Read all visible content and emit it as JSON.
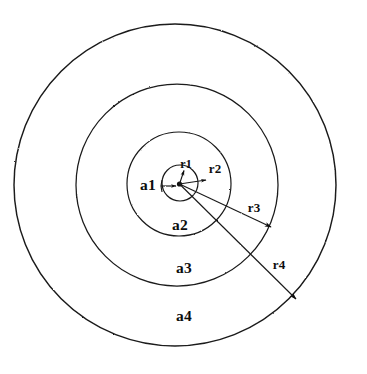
{
  "figure": {
    "background_color": "#ffffff",
    "stroke_color": "#1a1a1a",
    "center": {
      "x": 179,
      "y": 183
    },
    "zone_labels": [
      {
        "id": "a1",
        "text": "a1",
        "x": 148,
        "y": 189
      },
      {
        "id": "a2",
        "text": "a2",
        "x": 180,
        "y": 229
      },
      {
        "id": "a3",
        "text": "a3",
        "x": 184,
        "y": 272
      },
      {
        "id": "a4",
        "text": "a4",
        "x": 184,
        "y": 320
      }
    ],
    "radius_labels": [
      {
        "id": "r1",
        "text": "r1",
        "x": 186,
        "y": 167
      },
      {
        "id": "r2",
        "text": "r2",
        "x": 214,
        "y": 172
      },
      {
        "id": "r3",
        "text": "r3",
        "x": 253,
        "y": 211
      },
      {
        "id": "r4",
        "text": "r4",
        "x": 278,
        "y": 268
      }
    ],
    "rings": [
      {
        "id": "ring-a1",
        "label": "a1",
        "radius": 18,
        "cx": 180,
        "cy": 183,
        "stroke_width": 1.2
      },
      {
        "id": "ring-a2",
        "label": "a2",
        "radius": 52,
        "cx": 179,
        "cy": 184,
        "stroke_width": 1.2
      },
      {
        "id": "ring-a3",
        "label": "a3",
        "radius": 101,
        "cx": 177,
        "cy": 185,
        "stroke_width": 1.2
      },
      {
        "id": "ring-a4",
        "label": "a4",
        "radius": 161,
        "cx": 175,
        "cy": 185,
        "stroke_width": 1.4
      }
    ],
    "arrows": [
      {
        "id": "r1-arrow",
        "from": {
          "x": 179,
          "y": 183
        },
        "to": {
          "x": 184,
          "y": 170
        }
      },
      {
        "id": "r2-arrow",
        "from": {
          "x": 179,
          "y": 183
        },
        "to": {
          "x": 206,
          "y": 180
        }
      },
      {
        "id": "r3-arrow",
        "from": {
          "x": 179,
          "y": 183
        },
        "to": {
          "x": 272,
          "y": 228
        }
      },
      {
        "id": "r4-arrow",
        "from": {
          "x": 179,
          "y": 183
        },
        "to": {
          "x": 297,
          "y": 300
        }
      },
      {
        "id": "a1-tick-arrow",
        "from": {
          "x": 162,
          "y": 186
        },
        "to": {
          "x": 175,
          "y": 186
        }
      }
    ]
  }
}
